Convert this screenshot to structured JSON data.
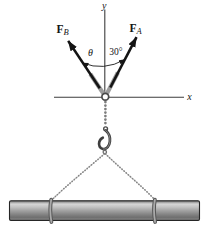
{
  "diagram": {
    "kind": "statics-force-diagram",
    "axes": {
      "x_label": "x",
      "y_label": "y"
    },
    "forces": {
      "a": {
        "symbol": "F",
        "subscript": "A",
        "angle_from_y_axis": "30°",
        "direction": "up-right"
      },
      "b": {
        "symbol": "F",
        "subscript": "B",
        "angle_from_y_axis": "θ",
        "direction": "up-left"
      }
    },
    "angle_labels": {
      "theta": "θ",
      "thirty_degrees": "30°"
    },
    "objects": [
      "ring",
      "chain",
      "hook",
      "sling-chains",
      "beam"
    ],
    "colors": {
      "arrow_black": "#141414",
      "axis_gray": "#3d3d3d",
      "chain_stub_gray": "#9c9c9c",
      "bead_gray": "#7d7d7d",
      "hook_gray": "#3e3e3e",
      "beam_highlight": "#d6d6d6",
      "beam_shadow": "#6f6f6f",
      "beam_outline": "#262626"
    }
  }
}
